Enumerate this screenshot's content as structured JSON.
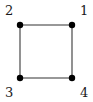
{
  "figure": {
    "type": "undirected-graph-diagram",
    "background_color": "#ffffff",
    "width": 93,
    "height": 102,
    "node_color": "#000000",
    "node_radius": 3.2,
    "edge_color": "#767676",
    "edge_width": 1.6,
    "label_color": "#1a1a1a",
    "label_font_size": 13
  },
  "graph_data": {
    "nodes": [
      {
        "id": "n1",
        "label": "1",
        "x": 72,
        "y": 25,
        "label_x": 80,
        "label_y": 4,
        "label_position": "upper-right"
      },
      {
        "id": "n2",
        "label": "2",
        "x": 20,
        "y": 25,
        "label_x": 5,
        "label_y": 4,
        "label_position": "upper-left"
      },
      {
        "id": "n3",
        "label": "3",
        "x": 20,
        "y": 78,
        "label_x": 5,
        "label_y": 86,
        "label_position": "lower-left"
      },
      {
        "id": "n4",
        "label": "4",
        "x": 72,
        "y": 78,
        "label_x": 80,
        "label_y": 86,
        "label_position": "lower-right"
      }
    ],
    "edges": [
      {
        "id": "e21",
        "source": "n2",
        "target": "n1",
        "x1": 20,
        "y1": 25,
        "x2": 72,
        "y2": 25
      },
      {
        "id": "e23",
        "source": "n2",
        "target": "n3",
        "x1": 20,
        "y1": 25,
        "x2": 20,
        "y2": 78
      },
      {
        "id": "e34",
        "source": "n3",
        "target": "n4",
        "x1": 20,
        "y1": 78,
        "x2": 72,
        "y2": 78
      },
      {
        "id": "e14",
        "source": "n1",
        "target": "n4",
        "x1": 72,
        "y1": 25,
        "x2": 72,
        "y2": 78
      }
    ]
  }
}
